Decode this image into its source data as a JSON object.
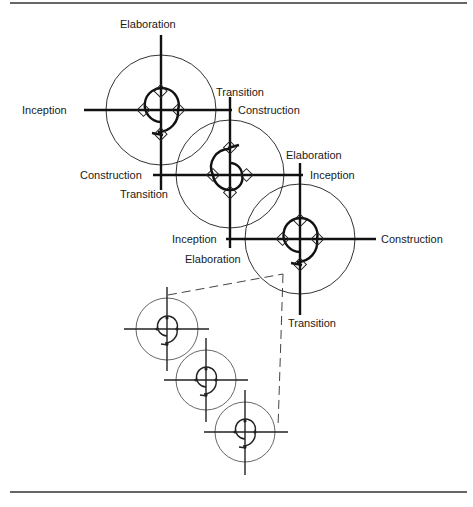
{
  "figure": {
    "large_cycles": [
      {
        "id": "cycle-1",
        "labels": {
          "top": "Elaboration",
          "left": "Inception",
          "right": "Construction",
          "right_upper": "Transition"
        }
      },
      {
        "id": "cycle-2",
        "labels": {
          "left": "Construction",
          "bottom_left": "Transition",
          "top_right": "Elaboration",
          "right": "Inception"
        }
      },
      {
        "id": "cycle-3",
        "labels": {
          "left": "Inception",
          "bottom_left": "Elaboration",
          "right": "Construction",
          "bottom": "Transition"
        }
      }
    ],
    "small_cycles_count": 3,
    "colors": {
      "line": "#111111",
      "ring": "#333333",
      "background": "#ffffff"
    }
  }
}
